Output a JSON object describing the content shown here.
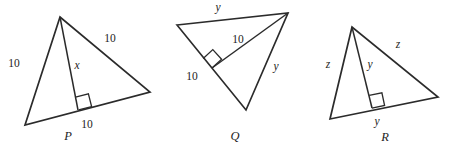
{
  "figure": {
    "background_color": "#ffffff",
    "stroke_color": "#2b2b2b",
    "text_color": "#1d1d1d"
  },
  "triangles": [
    {
      "id": "P",
      "name_label": "P",
      "name_pos": {
        "x": 68,
        "y": 136
      },
      "vertices": {
        "apex": {
          "x": 60,
          "y": 17
        },
        "bottom_left": {
          "x": 25,
          "y": 125
        },
        "right": {
          "x": 150,
          "y": 92
        }
      },
      "cevian": {
        "from": "apex",
        "foot": {
          "x": 78,
          "y": 110
        }
      },
      "right_angle": {
        "corner": {
          "x": 78,
          "y": 110
        },
        "size": 13
      },
      "labels": [
        {
          "id": "p-left-side",
          "text": "10",
          "style": "num",
          "x": 14,
          "y": 64
        },
        {
          "id": "p-right-side",
          "text": "10",
          "style": "num",
          "x": 110,
          "y": 39
        },
        {
          "id": "p-cevian",
          "text": "x",
          "style": "var",
          "x": 77,
          "y": 66
        },
        {
          "id": "p-base-segment",
          "text": "10",
          "style": "num",
          "x": 87,
          "y": 125
        }
      ]
    },
    {
      "id": "Q",
      "name_label": "Q",
      "name_pos": {
        "x": 235,
        "y": 136
      },
      "vertices": {
        "left": {
          "x": 177,
          "y": 25
        },
        "right": {
          "x": 288,
          "y": 13
        },
        "bottom": {
          "x": 246,
          "y": 110
        }
      },
      "cevian": {
        "from": "right",
        "foot": {
          "x": 212,
          "y": 68
        }
      },
      "right_angle": {
        "corner": {
          "x": 212,
          "y": 68
        },
        "size": 13
      },
      "labels": [
        {
          "id": "q-top-side",
          "text": "y",
          "style": "var",
          "x": 218,
          "y": 8
        },
        {
          "id": "q-cevian",
          "text": "10",
          "style": "num",
          "x": 238,
          "y": 40
        },
        {
          "id": "q-left-side",
          "text": "10",
          "style": "num",
          "x": 192,
          "y": 77
        },
        {
          "id": "q-right-side",
          "text": "y",
          "style": "var",
          "x": 276,
          "y": 67
        }
      ]
    },
    {
      "id": "R",
      "name_label": "R",
      "name_pos": {
        "x": 385,
        "y": 137
      },
      "vertices": {
        "apex": {
          "x": 352,
          "y": 27
        },
        "bottom_left": {
          "x": 330,
          "y": 119
        },
        "right": {
          "x": 438,
          "y": 97
        }
      },
      "cevian": {
        "from": "apex",
        "foot": {
          "x": 372,
          "y": 108
        }
      },
      "right_angle": {
        "corner": {
          "x": 372,
          "y": 108
        },
        "size": 13
      },
      "labels": [
        {
          "id": "r-left-side",
          "text": "z",
          "style": "var",
          "x": 328,
          "y": 65
        },
        {
          "id": "r-right-side",
          "text": "z",
          "style": "var",
          "x": 398,
          "y": 45
        },
        {
          "id": "r-cevian",
          "text": "y",
          "style": "var",
          "x": 370,
          "y": 65
        },
        {
          "id": "r-base-segment",
          "text": "y",
          "style": "var",
          "x": 377,
          "y": 122
        }
      ]
    }
  ]
}
